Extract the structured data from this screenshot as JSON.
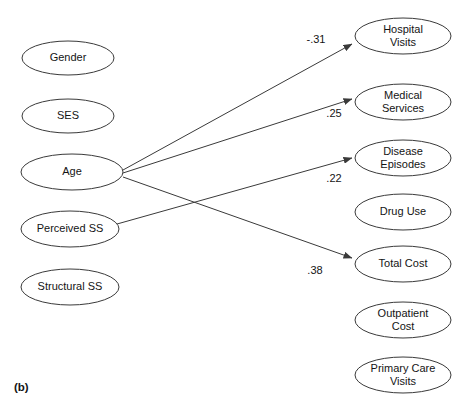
{
  "figure": {
    "caption": "(b)",
    "caption_x": 14,
    "caption_y": 388
  },
  "chart_data": {
    "type": "diagram",
    "title": "",
    "subtitle": "",
    "diagram_kind": "path-diagram",
    "predictor_nodes": [
      {
        "id": "gender",
        "label": "Gender",
        "cx": 68,
        "cy": 58,
        "rx": 46,
        "ry": 17
      },
      {
        "id": "ses",
        "label": "SES",
        "cx": 68,
        "cy": 116,
        "rx": 46,
        "ry": 17
      },
      {
        "id": "age",
        "label": "Age",
        "cx": 72,
        "cy": 172,
        "rx": 51,
        "ry": 18
      },
      {
        "id": "perceived-ss",
        "label": "Perceived SS",
        "cx": 70,
        "cy": 229,
        "rx": 49,
        "ry": 18
      },
      {
        "id": "structural-ss",
        "label": "Structural SS",
        "cx": 70,
        "cy": 287,
        "rx": 49,
        "ry": 18
      }
    ],
    "outcome_nodes": [
      {
        "id": "hospital-visits",
        "label_line1": "Hospital",
        "label_line2": "Visits",
        "cx": 403,
        "cy": 36,
        "rx": 48,
        "ry": 18
      },
      {
        "id": "medical-services",
        "label_line1": "Medical",
        "label_line2": "Services",
        "cx": 403,
        "cy": 102,
        "rx": 48,
        "ry": 18
      },
      {
        "id": "disease-episodes",
        "label_line1": "Disease",
        "label_line2": "Episodes",
        "cx": 403,
        "cy": 158,
        "rx": 48,
        "ry": 18
      },
      {
        "id": "drug-use",
        "label_line1": "Drug Use",
        "label_line2": "",
        "cx": 403,
        "cy": 212,
        "rx": 48,
        "ry": 18
      },
      {
        "id": "total-cost",
        "label_line1": "Total Cost",
        "label_line2": "",
        "cx": 403,
        "cy": 264,
        "rx": 48,
        "ry": 18
      },
      {
        "id": "outpatient-cost",
        "label_line1": "Outpatient",
        "label_line2": "Cost",
        "cx": 403,
        "cy": 320,
        "rx": 48,
        "ry": 18
      },
      {
        "id": "primary-care-visits",
        "label_line1": "Primary Care",
        "label_line2": "Visits",
        "cx": 403,
        "cy": 375,
        "rx": 48,
        "ry": 18
      }
    ],
    "paths": [
      {
        "id": "age-to-hospital-visits",
        "from": "age",
        "to": "hospital-visits",
        "coefficient": "-.31",
        "x1": 123,
        "y1": 170,
        "x2": 352,
        "y2": 44,
        "label_x": 316,
        "label_y": 40
      },
      {
        "id": "age-to-medical-services",
        "from": "age",
        "to": "medical-services",
        "coefficient": ".25",
        "x1": 123,
        "y1": 173,
        "x2": 352,
        "y2": 99,
        "label_x": 334,
        "label_y": 114
      },
      {
        "id": "perceived-ss-to-disease-episodes",
        "from": "perceived-ss",
        "to": "disease-episodes",
        "coefficient": ".22",
        "x1": 117,
        "y1": 224,
        "x2": 352,
        "y2": 158,
        "label_x": 334,
        "label_y": 179
      },
      {
        "id": "age-to-total-cost",
        "from": "age",
        "to": "total-cost",
        "coefficient": ".38",
        "x1": 123,
        "y1": 177,
        "x2": 352,
        "y2": 258,
        "label_x": 315,
        "label_y": 271
      }
    ],
    "colors": {
      "stroke": "#3a3a3a",
      "text": "#141414",
      "background": "#ffffff"
    }
  }
}
